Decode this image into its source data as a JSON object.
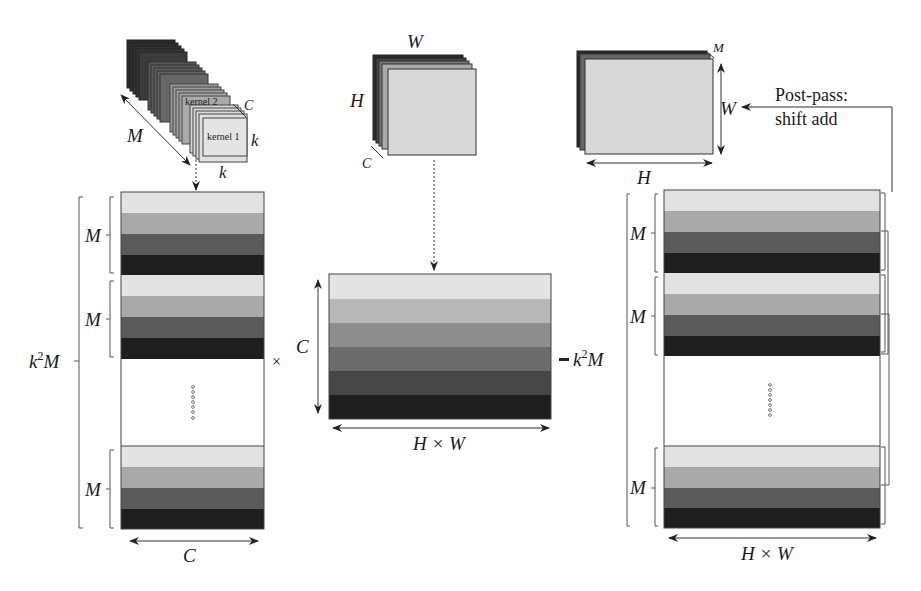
{
  "colors": {
    "band_1": "#e2e2e2",
    "band_2": "#a9a9a9",
    "band_3": "#5a5a5a",
    "band_4": "#1e1e1e",
    "six_band": [
      "#e2e2e2",
      "#b8b8b8",
      "#8e8e8e",
      "#6c6c6c",
      "#474747",
      "#1e1e1e"
    ],
    "plane_light": "#d9d9d9",
    "outline": "#333333"
  },
  "kernels": {
    "kernel_1_label": "kernel 1",
    "kernel_2_label": "kernel 2",
    "dim_M": "M",
    "dim_C": "C",
    "dim_k_side": "k",
    "dim_k_bottom": "k"
  },
  "input_tensor": {
    "dim_W": "W",
    "dim_H": "H",
    "dim_C": "C"
  },
  "output_tensor": {
    "dim_M": "M",
    "dim_W": "W",
    "dim_H": "H"
  },
  "post_pass": {
    "line1": "Post-pass:",
    "line2": "shift add"
  },
  "left_matrix": {
    "outer_label_base": "k",
    "outer_label_sup": "2",
    "outer_label_tail": "M",
    "group_labels": [
      "M",
      "M",
      "M"
    ],
    "width_label": "C"
  },
  "operators": {
    "multiply": "×",
    "equals": "="
  },
  "middle_matrix": {
    "height_label": "C",
    "width_label": "H × W",
    "rows_label_base": "k",
    "rows_label_sup": "2",
    "rows_label_tail": "M"
  },
  "right_matrix": {
    "group_labels": [
      "M",
      "M",
      "M"
    ],
    "width_label": "H × W"
  }
}
